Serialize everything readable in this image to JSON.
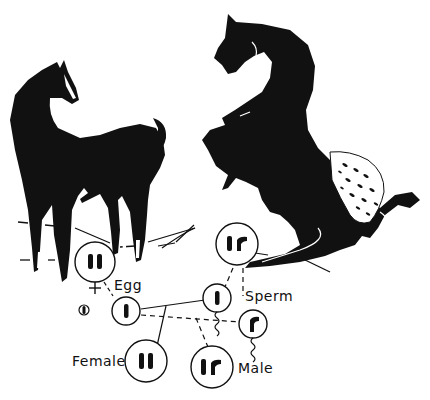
{
  "figure": {
    "colors": {
      "ink": "#111111",
      "paper": "#ffffff"
    }
  },
  "horses": [
    {
      "name": "solid-mare",
      "description": "Standing solid dark horse (female parent)"
    },
    {
      "name": "appaloosa-stallion",
      "description": "Rearing horse with spotted blanket (male parent)"
    }
  ],
  "cells": {
    "mother": {
      "chromosomes": "II",
      "symbol": "♀"
    },
    "father": {
      "chromosomes": "Ir"
    },
    "egg": {
      "chromosomes": "I",
      "label": "Egg"
    },
    "egg_polar": {
      "chromosomes": "I"
    },
    "sperm_1": {
      "chromosomes": "I",
      "label": "Sperm"
    },
    "sperm_2": {
      "chromosomes": "r"
    },
    "offspring_female": {
      "chromosomes": "II",
      "label": "Female"
    },
    "offspring_male": {
      "chromosomes": "Ir",
      "label": "Male"
    }
  }
}
